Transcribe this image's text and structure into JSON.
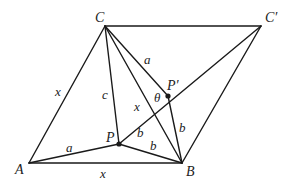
{
  "diagram": {
    "type": "geometry",
    "colors": {
      "stroke": "#1a1a1a",
      "text": "#222222",
      "background": "#ffffff"
    },
    "vertices": {
      "A": {
        "label": "A",
        "x": 29,
        "y": 163
      },
      "B": {
        "label": "B",
        "x": 182,
        "y": 163
      },
      "C": {
        "label": "C",
        "x": 105,
        "y": 26
      },
      "Cp": {
        "label": "C′",
        "x": 261,
        "y": 26
      },
      "P": {
        "label": "P",
        "x": 119,
        "y": 144
      },
      "Pp": {
        "label": "P′",
        "x": 168,
        "y": 96
      }
    },
    "segments": [
      {
        "from": "A",
        "to": "B",
        "label": "x"
      },
      {
        "from": "A",
        "to": "C",
        "label": "x"
      },
      {
        "from": "A",
        "to": "P",
        "label": "a"
      },
      {
        "from": "C",
        "to": "P",
        "label": "c"
      },
      {
        "from": "C",
        "to": "B",
        "label": "x"
      },
      {
        "from": "C",
        "to": "Pp",
        "label": "a"
      },
      {
        "from": "C",
        "to": "Cp",
        "label": ""
      },
      {
        "from": "Cp",
        "to": "B",
        "label": ""
      },
      {
        "from": "Cp",
        "to": "P",
        "label": ""
      },
      {
        "from": "P",
        "to": "Pp",
        "label": "b"
      },
      {
        "from": "P",
        "to": "B",
        "label": "b"
      },
      {
        "from": "Pp",
        "to": "B",
        "label": "b"
      }
    ],
    "labels": {
      "A": "A",
      "B": "B",
      "C": "C",
      "C_prime": "C′",
      "P": "P",
      "P_prime": "P′",
      "theta": "θ",
      "x_AC": "x",
      "x_AB": "x",
      "x_CB": "x",
      "a_AP": "a",
      "a_CPp": "a",
      "c_CP": "c",
      "b_PPp": "b",
      "b_PB": "b",
      "b_PpB": "b"
    },
    "angle": {
      "label": "θ",
      "at": "P′",
      "between": [
        "C",
        "P"
      ]
    }
  }
}
